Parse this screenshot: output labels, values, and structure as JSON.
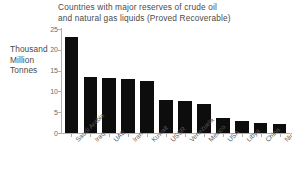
{
  "chart_data": {
    "type": "bar",
    "title": "Countries with major reserves of crude oil and natural gas liquids (Proved Recoverable)",
    "title_line1": "Countries with major reserves of crude oil",
    "title_line2": "and natural gas liquids (Proved Recoverable)",
    "ylabel": "Thousand Million Tonnes",
    "ylabel_line1": "Thousand",
    "ylabel_line2": "Million",
    "ylabel_line3": "Tonnes",
    "xlabel": "",
    "ylim": [
      0,
      25
    ],
    "yticks": [
      0,
      5,
      10,
      15,
      20,
      25
    ],
    "ytick_labels": [
      "0",
      "5",
      "10",
      "15",
      "20",
      "25"
    ],
    "grid": false,
    "legend": false,
    "bar_color": "#0d0d0d",
    "axis_color": "#b0b0b0",
    "categories": [
      "Saudi Arabia",
      "Iraq",
      "UAE",
      "Iran",
      "Kuwait",
      "USSR",
      "Venezuela",
      "Mexico",
      "USA",
      "Libya",
      "China",
      "Nigeria"
    ],
    "values": [
      23.1,
      13.4,
      13.2,
      12.9,
      12.6,
      8.0,
      7.7,
      6.9,
      3.7,
      2.9,
      2.4,
      2.1
    ]
  }
}
